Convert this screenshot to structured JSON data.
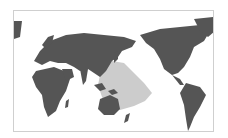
{
  "map": {
    "projection": "pacific-centered world map",
    "colors": {
      "background": "#ffffff",
      "land": "#555555",
      "highlight_region": "#cccccc",
      "frame_border": "#cfcfcf"
    },
    "highlighted_region": "Western and central Pacific Ocean (Southeast Asia to Polynesia)"
  }
}
